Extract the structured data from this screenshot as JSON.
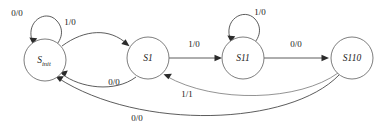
{
  "diagram": {
    "type": "state-machine",
    "canvas": {
      "width": 382,
      "height": 134
    },
    "colors": {
      "background": "#ffffff",
      "node_stroke": "#6f6f6f",
      "edge_stroke": "#4a4a4a",
      "text": "#1a1a1a"
    },
    "states": [
      {
        "id": "s_init",
        "label": "S",
        "subscript": "init",
        "cx": 45,
        "cy": 60,
        "r": 21
      },
      {
        "id": "s1",
        "label": "S1",
        "subscript": "",
        "cx": 148,
        "cy": 58,
        "r": 21
      },
      {
        "id": "s11",
        "label": "S11",
        "subscript": "",
        "cx": 243,
        "cy": 58,
        "r": 21
      },
      {
        "id": "s110",
        "label": "S110",
        "subscript": "",
        "cx": 352,
        "cy": 58,
        "r": 21
      }
    ],
    "transitions": [
      {
        "id": "t1",
        "from": "s_init",
        "to": "s_init",
        "label": "0/0",
        "label_x": 17,
        "label_y": 14,
        "kind": "self-loop"
      },
      {
        "id": "t2",
        "from": "s_init",
        "to": "s1",
        "label": "1/0",
        "label_x": 70,
        "label_y": 23,
        "kind": "curve"
      },
      {
        "id": "t3",
        "from": "s1",
        "to": "s11",
        "label": "1/0",
        "label_x": 194,
        "label_y": 45,
        "kind": "straight"
      },
      {
        "id": "t4",
        "from": "s11",
        "to": "s11",
        "label": "1/0",
        "label_x": 260,
        "label_y": 13,
        "kind": "self-loop"
      },
      {
        "id": "t5",
        "from": "s11",
        "to": "s110",
        "label": "0/0",
        "label_x": 296,
        "label_y": 45,
        "kind": "straight"
      },
      {
        "id": "t6",
        "from": "s1",
        "to": "s_init",
        "label": "0/0",
        "label_x": 114,
        "label_y": 83,
        "kind": "curve"
      },
      {
        "id": "t7",
        "from": "s110",
        "to": "s1",
        "label": "1/1",
        "label_x": 187,
        "label_y": 95,
        "kind": "curve"
      },
      {
        "id": "t8",
        "from": "s110",
        "to": "s_init",
        "label": "0/0",
        "label_x": 137,
        "label_y": 119,
        "kind": "curve"
      }
    ]
  }
}
